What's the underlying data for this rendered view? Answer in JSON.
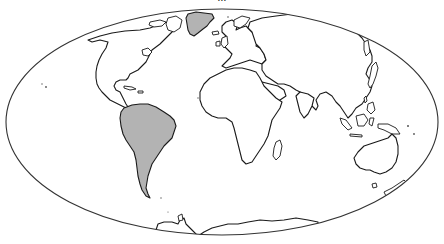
{
  "caption": {
    "text": "...",
    "note": "partially clipped caption line at top edge, illegible"
  },
  "map": {
    "projection": "Mollweide (elliptical world outline)",
    "ellipse": {
      "cx": 222,
      "cy": 122,
      "rx": 216,
      "ry": 113
    },
    "colors": {
      "land": "#ffffff",
      "outline": "#1a1a1a",
      "highlight": "#b3b3b3",
      "background": "#ffffff"
    },
    "highlighted_regions": [
      "South America",
      "Greenland"
    ],
    "regions": [
      {
        "name": "North America",
        "highlighted": false
      },
      {
        "name": "Greenland",
        "highlighted": true
      },
      {
        "name": "South America",
        "highlighted": true
      },
      {
        "name": "Europe",
        "highlighted": false
      },
      {
        "name": "Africa",
        "highlighted": false
      },
      {
        "name": "Madagascar",
        "highlighted": false
      },
      {
        "name": "Asia",
        "highlighted": false
      },
      {
        "name": "Arabian Peninsula",
        "highlighted": false
      },
      {
        "name": "Japan",
        "highlighted": false
      },
      {
        "name": "Southeast Asia / Indonesia",
        "highlighted": false
      },
      {
        "name": "Australia",
        "highlighted": false
      },
      {
        "name": "Tasmania",
        "highlighted": false
      },
      {
        "name": "New Zealand",
        "highlighted": false
      },
      {
        "name": "Antarctica",
        "highlighted": false
      }
    ]
  }
}
